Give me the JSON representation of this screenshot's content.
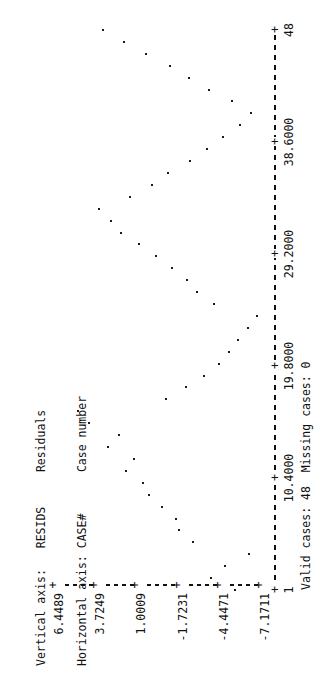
{
  "legend": {
    "line1_label": "Vertical axis:",
    "line1_value": "RESIDS",
    "line1_desc": "Residuals",
    "line2_label": "Horizontal axis:",
    "line2_value": "CASE#",
    "line2_desc": "Case number"
  },
  "footer": {
    "valid_label": "Valid cases:",
    "valid_value": "48",
    "missing_label": "Missing cases:",
    "missing_value": "0"
  },
  "colors": {
    "ink": "#111111",
    "point": "#1a1a1a",
    "background": "#ffffff"
  },
  "chart_data": {
    "type": "scatter",
    "title": "",
    "xlabel": "Case number",
    "ylabel": "Residuals",
    "x_variable": "CASE#",
    "y_variable": "RESIDS",
    "grid": false,
    "legend_position": "top-left",
    "xlim": [
      1,
      48
    ],
    "ylim": [
      -7.1711,
      6.4489
    ],
    "x_tick_labels": [
      "1",
      "10.4000",
      "19.8000",
      "29.2000",
      "38.6000",
      "48"
    ],
    "x_tick_values": [
      1,
      10.4,
      19.8,
      29.2,
      38.6,
      48
    ],
    "y_tick_labels": [
      "6.4489",
      "3.7249",
      "1.0009",
      "-1.7231",
      "-4.4471",
      "-7.1711"
    ],
    "y_tick_values": [
      6.4489,
      3.7249,
      1.0009,
      -1.7231,
      -4.4471,
      -7.1711
    ],
    "n_valid": 48,
    "n_missing": 0,
    "points": [
      {
        "x": 1,
        "y": -5.1
      },
      {
        "x": 2,
        "y": -3.55
      },
      {
        "x": 3,
        "y": -4.45
      },
      {
        "x": 4,
        "y": -6.05
      },
      {
        "x": 5,
        "y": -2.35
      },
      {
        "x": 6,
        "y": -1.45
      },
      {
        "x": 7,
        "y": -1.2
      },
      {
        "x": 8,
        "y": -0.3
      },
      {
        "x": 9,
        "y": 0.55
      },
      {
        "x": 10,
        "y": 0.95
      },
      {
        "x": 11,
        "y": 2.1
      },
      {
        "x": 12,
        "y": 1.55
      },
      {
        "x": 13,
        "y": 3.3
      },
      {
        "x": 14,
        "y": 2.55
      },
      {
        "x": 15,
        "y": 4.55
      },
      {
        "x": 16,
        "y": 5.25
      },
      {
        "x": 17,
        "y": -0.55
      },
      {
        "x": 18,
        "y": -1.85
      },
      {
        "x": 19,
        "y": -3.05
      },
      {
        "x": 20,
        "y": -4.05
      },
      {
        "x": 21,
        "y": -4.75
      },
      {
        "x": 22,
        "y": -5.3
      },
      {
        "x": 23,
        "y": -5.95
      },
      {
        "x": 24,
        "y": -6.55
      },
      {
        "x": 25,
        "y": -3.7
      },
      {
        "x": 26,
        "y": -2.6
      },
      {
        "x": 27,
        "y": -1.95
      },
      {
        "x": 28,
        "y": -0.95
      },
      {
        "x": 29,
        "y": 0.1
      },
      {
        "x": 30,
        "y": 1.2
      },
      {
        "x": 31,
        "y": 2.4
      },
      {
        "x": 32,
        "y": 3.05
      },
      {
        "x": 33,
        "y": 3.85
      },
      {
        "x": 34,
        "y": 1.85
      },
      {
        "x": 35,
        "y": 0.35
      },
      {
        "x": 36,
        "y": -0.7
      },
      {
        "x": 37,
        "y": -2.15
      },
      {
        "x": 38,
        "y": -3.25
      },
      {
        "x": 39,
        "y": -4.3
      },
      {
        "x": 40,
        "y": -5.45
      },
      {
        "x": 41,
        "y": -6.2
      },
      {
        "x": 42,
        "y": -4.9
      },
      {
        "x": 43,
        "y": -3.4
      },
      {
        "x": 44,
        "y": -2.05
      },
      {
        "x": 45,
        "y": -0.85
      },
      {
        "x": 46,
        "y": 0.75
      },
      {
        "x": 47,
        "y": 2.2
      },
      {
        "x": 48,
        "y": 3.6
      }
    ]
  }
}
